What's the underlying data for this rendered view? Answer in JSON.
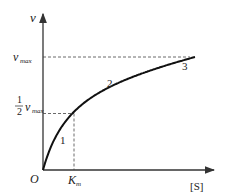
{
  "chart_data": {
    "type": "line",
    "title": "",
    "xlabel": "[S]",
    "ylabel": "v",
    "origin_label": "O",
    "x_ticks": [
      {
        "value": 1,
        "label": "K",
        "sub": "m"
      }
    ],
    "y_ticks": [
      {
        "value": 1.0,
        "label": "v",
        "sub": "max"
      },
      {
        "value": 0.5,
        "label_frac_num": "1",
        "label_frac_den": "2",
        "label": "v",
        "sub": "max"
      }
    ],
    "xlim": [
      0,
      5.0
    ],
    "ylim": [
      0,
      1.2
    ],
    "vmax": 1.0,
    "km": 1.0,
    "series": [
      {
        "name": "Michaelis-Menten curve",
        "equation": "v = vmax*[S]/(Km+[S])"
      }
    ],
    "region_labels": [
      {
        "text": "1",
        "x": 0.6,
        "y": 0.25
      },
      {
        "text": "2",
        "x": 2.2,
        "y": 0.75
      },
      {
        "text": "3",
        "x": 4.5,
        "y": 0.96
      }
    ],
    "grid": false,
    "legend": "none"
  }
}
